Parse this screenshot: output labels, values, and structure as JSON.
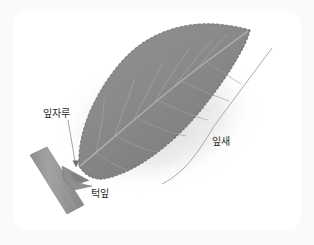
{
  "figure": {
    "kind": "botanical-leaf-diagram",
    "background_color": "#fafafa",
    "panel_color": "#ffffff"
  },
  "labels": {
    "petiole": "잎자루",
    "stipule": "턱잎",
    "blade": "잎새"
  },
  "palette": {
    "leaf_fill": "#8b8b8b",
    "leaf_fill_dark": "#7e7e7e",
    "leaf_edge": "#6f6f6f",
    "vein": "#a9a9a9",
    "midrib": "#b4b4b4",
    "petiole_fill": "#9a9a9a",
    "petiole_edge": "#7d7d7d",
    "stipule_fill": "#8f8f8f",
    "shadow": "#d8d8d8",
    "leader_line": "#9a9a9a",
    "text": "#2b2b2b"
  },
  "annotations": {
    "petiole_leader": "line from petiole label down to petiole stalk",
    "stipule_leader": "line from stipule label up-left to stipule wing",
    "blade_leader": "long bent line along the right margin of the leaf blade"
  }
}
